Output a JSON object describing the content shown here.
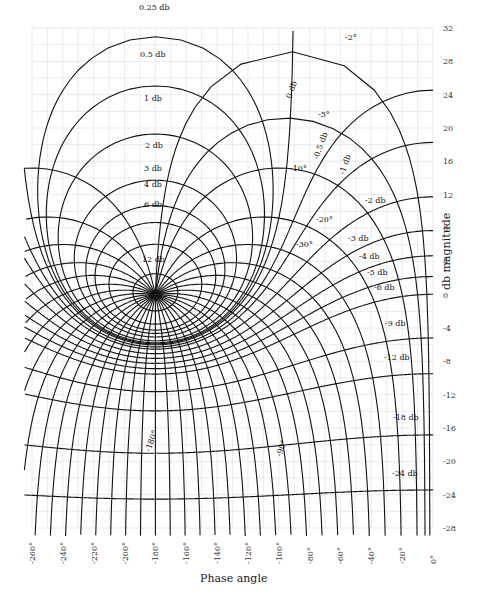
{
  "chart_data": {
    "type": "nichols",
    "title": "",
    "xlabel": "Phase angle",
    "ylabel": "db magnitude",
    "xlim": [
      -260,
      0
    ],
    "ylim": [
      -28,
      32
    ],
    "grid": true,
    "x_ticks": [
      "-260°",
      "-240°",
      "-220°",
      "-200°",
      "-180°",
      "-160°",
      "-140°",
      "-120°",
      "-100°",
      "-80°",
      "-60°",
      "-40°",
      "-20°",
      "0°"
    ],
    "y_ticks": [
      "32",
      "28",
      "24",
      "20",
      "16",
      "12",
      "8",
      "4",
      "0",
      "-4",
      "-8",
      "-12",
      "-16",
      "-20",
      "-24",
      "-28"
    ],
    "m_contours_db": [
      "0.25 db",
      "0.5 db",
      "1 db",
      "2 db",
      "3 db",
      "4 db",
      "6 db",
      "12 db",
      "0 db",
      "-0.5 db",
      "-1 db",
      "-2 db",
      "-3 db",
      "-4 db",
      "-5 db",
      "-6 db",
      "-9 db",
      "-12 db",
      "-18 db",
      "-24 db"
    ],
    "n_contours_deg": [
      "-2°",
      "-5°",
      "-10°",
      "-20°",
      "-30°",
      "-90°",
      "-180°"
    ]
  },
  "labels": {
    "x_title": "Phase angle",
    "y_title": "db magnitude"
  }
}
